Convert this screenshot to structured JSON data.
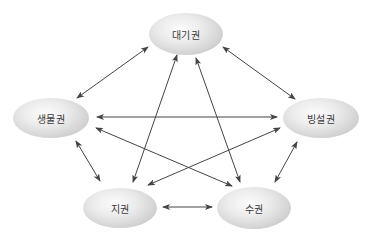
{
  "diagram": {
    "type": "earth-system-spheres-interaction",
    "nodes": [
      {
        "id": "atmosphere",
        "label": "대기권",
        "cx": 186,
        "cy": 34,
        "w": 74,
        "h": 42
      },
      {
        "id": "biosphere",
        "label": "생물권",
        "cx": 51,
        "cy": 118,
        "w": 76,
        "h": 40
      },
      {
        "id": "cryosphere",
        "label": "빙설권",
        "cx": 321,
        "cy": 118,
        "w": 76,
        "h": 40
      },
      {
        "id": "geosphere",
        "label": "지권",
        "cx": 120,
        "cy": 208,
        "w": 74,
        "h": 40
      },
      {
        "id": "hydrosphere",
        "label": "수권",
        "cx": 254,
        "cy": 208,
        "w": 74,
        "h": 42
      }
    ],
    "edges": [
      {
        "from": "atmosphere",
        "to": "biosphere",
        "bidirectional": true,
        "x1": 148,
        "y1": 47,
        "x2": 77,
        "y2": 98
      },
      {
        "from": "atmosphere",
        "to": "cryosphere",
        "bidirectional": true,
        "x1": 223,
        "y1": 47,
        "x2": 295,
        "y2": 99
      },
      {
        "from": "atmosphere",
        "to": "geosphere",
        "bidirectional": true,
        "x1": 177,
        "y1": 55,
        "x2": 133,
        "y2": 182
      },
      {
        "from": "atmosphere",
        "to": "hydrosphere",
        "bidirectional": true,
        "x1": 196,
        "y1": 58,
        "x2": 240,
        "y2": 182
      },
      {
        "from": "biosphere",
        "to": "cryosphere",
        "bidirectional": true,
        "x1": 97,
        "y1": 117,
        "x2": 277,
        "y2": 117
      },
      {
        "from": "biosphere",
        "to": "hydrosphere",
        "bidirectional": true,
        "x1": 96,
        "y1": 128,
        "x2": 232,
        "y2": 186
      },
      {
        "from": "cryosphere",
        "to": "geosphere",
        "bidirectional": true,
        "x1": 280,
        "y1": 128,
        "x2": 148,
        "y2": 185
      },
      {
        "from": "biosphere",
        "to": "geosphere",
        "bidirectional": true,
        "x1": 76,
        "y1": 141,
        "x2": 100,
        "y2": 181
      },
      {
        "from": "cryosphere",
        "to": "hydrosphere",
        "bidirectional": true,
        "x1": 297,
        "y1": 142,
        "x2": 275,
        "y2": 182
      },
      {
        "from": "geosphere",
        "to": "hydrosphere",
        "bidirectional": true,
        "x1": 163,
        "y1": 207,
        "x2": 212,
        "y2": 207
      }
    ],
    "colors": {
      "arrow": "#444444",
      "label": "#3a3a3a",
      "node_center": "#fbfbfb",
      "node_edge": "#b9b9b9",
      "background": "#ffffff"
    }
  }
}
